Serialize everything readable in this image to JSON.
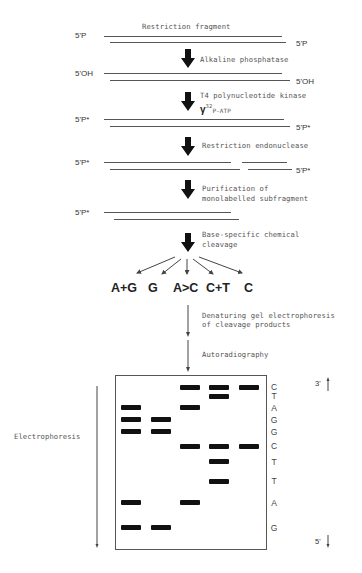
{
  "steps": {
    "s0": "Restriction fragment",
    "s1": "Alkaline phosphatase",
    "s2a": "T4 polynucleotide kinase",
    "s2b_gamma": "γ",
    "s2b_sup": "32",
    "s2b_rest": "P-ATP",
    "s3": "Restriction endonuclease",
    "s4a": "Purification of",
    "s4b": "monolabelled subfragment",
    "s5a": "Base-specific chemical",
    "s5b": "cleavage",
    "s6a": "Denaturing gel electrophoresis",
    "s6b": "of cleavage products",
    "s7": "Autoradiography"
  },
  "ends": {
    "p": "5'P",
    "oh": "5'OH",
    "pstar": "5'P*"
  },
  "reactions": [
    "A+G",
    "G",
    "A>C",
    "C+T",
    "C"
  ],
  "gel": {
    "sequence": [
      "C",
      "T",
      "A",
      "G",
      "G",
      "C",
      "T",
      "T",
      "A",
      "G"
    ],
    "top_label": "3'",
    "bottom_label": "5'",
    "side_label": "Electrophoresis"
  }
}
